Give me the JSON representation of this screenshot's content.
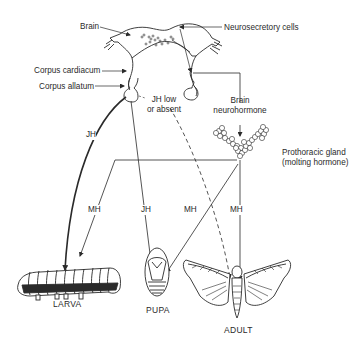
{
  "diagram": {
    "labels": {
      "brain": "Brain",
      "neurosecretory_cells": "Neurosecretory cells",
      "corpus_cardiacum": "Corpus cardiacum",
      "corpus_allatum": "Corpus allatum",
      "jh_low_line1": "JH low",
      "jh_low_line2": "or absent",
      "brain_neurohormone_line1": "Brain",
      "brain_neurohormone_line2": "neurohormone",
      "prothoracic_gland_line1": "Prothoracic gland",
      "prothoracic_gland_line2": "(molting hormone)"
    },
    "arrow_labels": {
      "jh_to_larva": "JH",
      "mh_to_larva": "MH",
      "jh_to_pupa": "JH",
      "mh_to_pupa": "MH",
      "mh_to_adult": "MH"
    },
    "stages": {
      "larva": "LARVA",
      "pupa": "PUPA",
      "adult": "ADULT"
    },
    "colors": {
      "ink": "#2a2a2a",
      "background": "#ffffff"
    }
  }
}
